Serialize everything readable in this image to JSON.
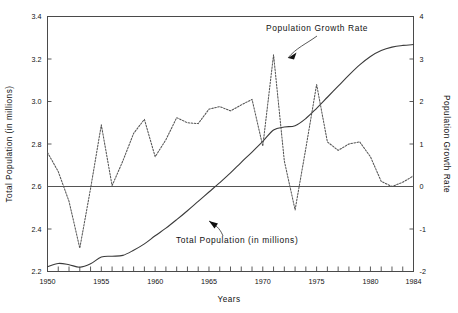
{
  "chart_data": {
    "type": "line",
    "title": "",
    "xlabel": "Years",
    "ylabel": "Total Population (in millions)",
    "y2label": "Population Growth Rate",
    "grid": false,
    "legend_position": "inline-annotations",
    "xlim": [
      1950,
      1984
    ],
    "ylim": [
      2.2,
      3.4
    ],
    "y2lim": [
      -2,
      4
    ],
    "xticks": [
      1950,
      1951,
      1952,
      1953,
      1954,
      1955,
      1956,
      1957,
      1958,
      1959,
      1960,
      1961,
      1962,
      1963,
      1964,
      1965,
      1966,
      1967,
      1968,
      1969,
      1970,
      1971,
      1972,
      1973,
      1974,
      1975,
      1976,
      1977,
      1978,
      1979,
      1980,
      1981,
      1982,
      1983,
      1984
    ],
    "xticklabels": [
      "1950",
      "1955",
      "1960",
      "1965",
      "1970",
      "1975",
      "1980",
      "1984"
    ],
    "xticklabel_years": [
      1950,
      1955,
      1960,
      1965,
      1970,
      1975,
      1980,
      1984
    ],
    "yticks": [
      2.2,
      2.4,
      2.6,
      2.8,
      3.0,
      3.2,
      3.4
    ],
    "yticklabels": [
      "2.2",
      "2.4",
      "2.6",
      "2.8",
      "3.0",
      "3.2",
      "3.4"
    ],
    "y2ticks": [
      -2,
      -1,
      0,
      1,
      2,
      3,
      4
    ],
    "y2ticklabels": [
      "-2",
      "-1",
      "0",
      "1",
      "2",
      "3",
      "4"
    ],
    "zero_reference_line": 0,
    "x": [
      1950,
      1951,
      1952,
      1953,
      1954,
      1955,
      1956,
      1957,
      1958,
      1959,
      1960,
      1961,
      1962,
      1963,
      1964,
      1965,
      1966,
      1967,
      1968,
      1969,
      1970,
      1971,
      1972,
      1973,
      1974,
      1975,
      1976,
      1977,
      1978,
      1979,
      1980,
      1981,
      1982,
      1983,
      1984
    ],
    "series": [
      {
        "name": "Total Population (in millions)",
        "axis": "left",
        "style": "solid",
        "units": "millions",
        "values": [
          2.222,
          2.238,
          2.232,
          2.22,
          2.236,
          2.268,
          2.272,
          2.276,
          2.3,
          2.33,
          2.368,
          2.404,
          2.444,
          2.486,
          2.53,
          2.574,
          2.618,
          2.664,
          2.714,
          2.762,
          2.812,
          2.866,
          2.88,
          2.886,
          2.92,
          2.968,
          3.02,
          3.072,
          3.124,
          3.172,
          3.212,
          3.24,
          3.256,
          3.264,
          3.268
        ]
      },
      {
        "name": "Population Growth Rate",
        "axis": "right",
        "style": "dashed",
        "units": "percent",
        "values": [
          0.8,
          0.35,
          -0.35,
          -1.45,
          -0.05,
          1.45,
          0.02,
          0.6,
          1.25,
          1.58,
          0.7,
          1.1,
          1.62,
          1.5,
          1.48,
          1.82,
          1.88,
          1.78,
          1.92,
          2.05,
          0.95,
          3.1,
          0.6,
          -0.55,
          0.9,
          2.4,
          1.05,
          0.85,
          1.0,
          1.05,
          0.7,
          0.12,
          0.0,
          0.1,
          0.25
        ]
      }
    ],
    "annotations": [
      {
        "text": "Population Growth Rate",
        "points_to_series": "Population Growth Rate",
        "points_to_x": 1971
      },
      {
        "text": "Total Population (in millions)",
        "points_to_series": "Total Population (in millions)",
        "points_to_x": 1963
      }
    ]
  },
  "axes": {
    "x_title": "Years",
    "y_left_title": "Total Population (in millions)",
    "y_right_title": "Population Growth Rate"
  }
}
